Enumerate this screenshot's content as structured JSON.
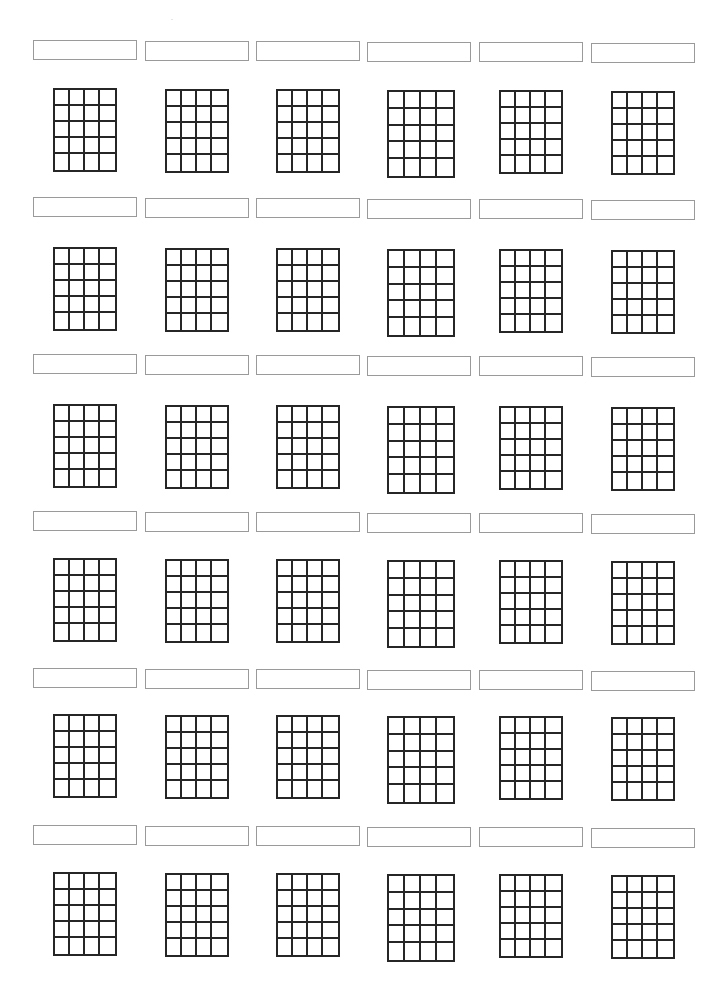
{
  "document": {
    "type": "blank chord chart worksheet",
    "grid_columns": 6,
    "grid_rows": 6,
    "diagram_strings_columns": 4,
    "diagram_frets_rows": 5,
    "line_color": "#262626",
    "box_border_color": "#9a9a9a"
  },
  "rows": [
    {
      "label_top": 40,
      "grid_top": 88
    },
    {
      "label_top": 197,
      "grid_top": 247
    },
    {
      "label_top": 354,
      "grid_top": 404
    },
    {
      "label_top": 511,
      "grid_top": 558
    },
    {
      "label_top": 668,
      "grid_top": 714
    },
    {
      "label_top": 825,
      "grid_top": 872
    }
  ],
  "columns": [
    {
      "label_left": 33
    },
    {
      "label_left": 145
    },
    {
      "label_left": 256
    },
    {
      "label_left": 367
    },
    {
      "label_left": 479
    },
    {
      "label_left": 591
    }
  ],
  "charts": [
    {
      "name": ""
    },
    {
      "name": ""
    },
    {
      "name": ""
    },
    {
      "name": ""
    },
    {
      "name": ""
    },
    {
      "name": ""
    },
    {
      "name": ""
    },
    {
      "name": ""
    },
    {
      "name": ""
    },
    {
      "name": ""
    },
    {
      "name": ""
    },
    {
      "name": ""
    },
    {
      "name": ""
    },
    {
      "name": ""
    },
    {
      "name": ""
    },
    {
      "name": ""
    },
    {
      "name": ""
    },
    {
      "name": ""
    },
    {
      "name": ""
    },
    {
      "name": ""
    },
    {
      "name": ""
    },
    {
      "name": ""
    },
    {
      "name": ""
    },
    {
      "name": ""
    },
    {
      "name": ""
    },
    {
      "name": ""
    },
    {
      "name": ""
    },
    {
      "name": ""
    },
    {
      "name": ""
    },
    {
      "name": ""
    },
    {
      "name": ""
    },
    {
      "name": ""
    },
    {
      "name": ""
    },
    {
      "name": ""
    },
    {
      "name": ""
    },
    {
      "name": ""
    }
  ]
}
